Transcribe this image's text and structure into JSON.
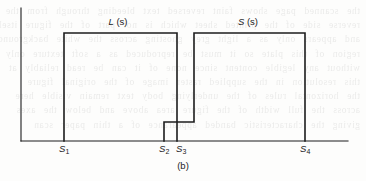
{
  "figure": {
    "caption": "(b)",
    "ink_color": "#1c1c1c",
    "background_color": "#fdfdfc",
    "curve_labels": [
      {
        "name": "L-curve-label",
        "func": "L",
        "arg": "(s)",
        "x": 118,
        "y": 16
      },
      {
        "name": "S-curve-label",
        "func": "S",
        "arg": "(s)",
        "x": 248,
        "y": 16
      }
    ],
    "tick_labels": [
      {
        "name": "tick-label-s1",
        "symbol": "S",
        "index": "1",
        "x": 64,
        "y": 143
      },
      {
        "name": "tick-label-s2",
        "symbol": "S",
        "index": "2",
        "x": 164,
        "y": 143
      },
      {
        "name": "tick-label-s3",
        "symbol": "S",
        "index": "3",
        "x": 181,
        "y": 143
      },
      {
        "name": "tick-label-s4",
        "symbol": "S",
        "index": "4",
        "x": 305,
        "y": 143
      }
    ],
    "bleed_text": [
      "the scanned page shows faint reversed text bleeding through from the",
      "reverse side of the printed sheet which is not part of the figure itself",
      "and appears only as a light grey ghosting across the white background",
      "region of this plate so it must be reproduced as a soft texture only",
      "without any legible content since none of it can be read reliably at",
      "this resolution in the supplied raster image of the original figure",
      "the horizontal rules of the underlying body text remain visible here",
      "across the full width of the figure area above and below the axes",
      "giving the characteristic banded appearance of a thin paper scan"
    ]
  },
  "chart_data": {
    "type": "line",
    "title": "(b)",
    "xlabel": "",
    "ylabel": "",
    "grid": false,
    "legend": "inline-curve-labels",
    "axes": {
      "y_axis": {
        "x": 21,
        "y_top": 8,
        "y_bottom": 141
      },
      "x_axis": {
        "y": 141,
        "x_left": 21,
        "x_right": 348
      }
    },
    "x_ticks": [
      {
        "label": "S1",
        "x": 64
      },
      {
        "label": "S2",
        "x": 164
      },
      {
        "label": "S3",
        "x": 181
      },
      {
        "label": "S4",
        "x": 305
      }
    ],
    "levels": {
      "baseline": 141,
      "low_step": 122,
      "high": 33
    },
    "series": [
      {
        "name": "L(s)",
        "description": "Rectangular pulse: rises at S1, flat high level, falls to baseline at S3.",
        "points": [
          {
            "x": 64,
            "y": 141
          },
          {
            "x": 64,
            "y": 33
          },
          {
            "x": 177,
            "y": 33
          },
          {
            "x": 177,
            "y": 141
          }
        ]
      },
      {
        "name": "S(s)",
        "description": "Step function: rises to a low step at S2, steps up to the high level just after S3, flat high level, falls to baseline at S4.",
        "points": [
          {
            "x": 164,
            "y": 141
          },
          {
            "x": 164,
            "y": 122
          },
          {
            "x": 194,
            "y": 122
          },
          {
            "x": 194,
            "y": 33
          },
          {
            "x": 305,
            "y": 33
          },
          {
            "x": 305,
            "y": 141
          }
        ]
      }
    ]
  }
}
